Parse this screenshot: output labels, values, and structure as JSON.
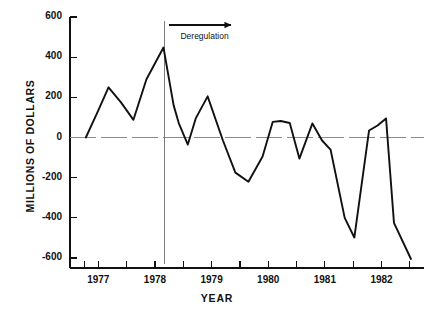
{
  "chart_data": {
    "type": "line",
    "title": "",
    "xlabel": "YEAR",
    "ylabel": "MILLIONS OF DOLLARS",
    "ylim": [
      -600,
      600
    ],
    "xlim": [
      1976.5,
      1982.75
    ],
    "ytick_values": [
      600,
      400,
      200,
      0,
      -200,
      -400,
      -600
    ],
    "ytick_labels": [
      "600",
      "400",
      "200",
      "0",
      "-200",
      "-400",
      "-600"
    ],
    "xtick_values": [
      1976.75,
      1977,
      1977.5,
      1978,
      1978.5,
      1979,
      1979.5,
      1980,
      1980.5,
      1981,
      1981.5,
      1982,
      1982.5
    ],
    "xtick_labels": [
      "1977",
      "1978",
      "1979",
      "1980",
      "1981",
      "1982"
    ],
    "xtick_label_values": [
      1977,
      1978,
      1979,
      1980,
      1981,
      1982
    ],
    "grid": false,
    "zero_line": true,
    "legend": "none",
    "annotations": [
      {
        "name": "deregulation-marker",
        "label": "Deregulation",
        "type": "vertical-line-with-arrow",
        "x": 1978.16,
        "arrow_direction": "right",
        "arrow_from_x": 1978.25,
        "arrow_to_x": 1979.35,
        "arrow_y": 560,
        "label_x": 1978.45,
        "label_y": 500
      }
    ],
    "series": [
      {
        "name": "net-operating-income",
        "color": "#111111",
        "points": [
          [
            1976.78,
            0
          ],
          [
            1977.0,
            135
          ],
          [
            1977.18,
            250
          ],
          [
            1977.4,
            175
          ],
          [
            1977.62,
            88
          ],
          [
            1977.85,
            290
          ],
          [
            1978.15,
            448
          ],
          [
            1978.33,
            160
          ],
          [
            1978.42,
            72
          ],
          [
            1978.58,
            -35
          ],
          [
            1978.72,
            95
          ],
          [
            1978.93,
            205
          ],
          [
            1979.2,
            -15
          ],
          [
            1979.42,
            -175
          ],
          [
            1979.65,
            -220
          ],
          [
            1979.9,
            -95
          ],
          [
            1980.08,
            78
          ],
          [
            1980.22,
            82
          ],
          [
            1980.38,
            72
          ],
          [
            1980.55,
            -105
          ],
          [
            1980.78,
            70
          ],
          [
            1980.95,
            -15
          ],
          [
            1981.1,
            -60
          ],
          [
            1981.35,
            -400
          ],
          [
            1981.52,
            -498
          ],
          [
            1981.78,
            35
          ],
          [
            1981.93,
            60
          ],
          [
            1982.08,
            95
          ],
          [
            1982.22,
            -425
          ],
          [
            1982.52,
            -605
          ]
        ]
      }
    ]
  },
  "axes": {
    "ytick_labels": [
      "600",
      "400",
      "200",
      "0",
      "-200",
      "-400",
      "-600"
    ],
    "xtick_labels": [
      "1977",
      "1978",
      "1979",
      "1980",
      "1981",
      "1982"
    ],
    "xlabel": "YEAR",
    "ylabel": "MILLIONS OF DOLLARS"
  },
  "annotation": {
    "deregulation_label": "Deregulation"
  }
}
